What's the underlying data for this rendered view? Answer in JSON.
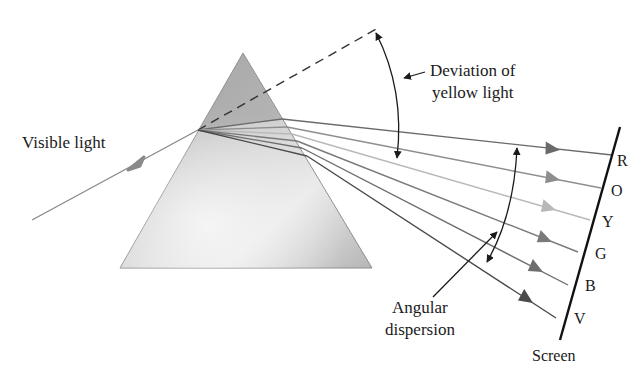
{
  "diagram": {
    "labels": {
      "incident": "Visible light",
      "deviation_line1": "Deviation of",
      "deviation_line2": "yellow light",
      "dispersion_line1": "Angular",
      "dispersion_line2": "dispersion",
      "screen": "Screen"
    },
    "spectrum": [
      {
        "letter": "R",
        "name": "red",
        "color": "#6a6a6a"
      },
      {
        "letter": "O",
        "name": "orange",
        "color": "#8e8e8e"
      },
      {
        "letter": "Y",
        "name": "yellow",
        "color": "#b8b8b8"
      },
      {
        "letter": "G",
        "name": "green",
        "color": "#7a7a7a"
      },
      {
        "letter": "B",
        "name": "blue",
        "color": "#6e6e6e"
      },
      {
        "letter": "V",
        "name": "violet",
        "color": "#4a4a4a"
      }
    ],
    "colors": {
      "prism_light": "#ececec",
      "prism_dark": "#9a9a9a",
      "incident_ray": "#8a8a8a",
      "screen": "#111111",
      "annotation": "#1a1a1a"
    }
  }
}
